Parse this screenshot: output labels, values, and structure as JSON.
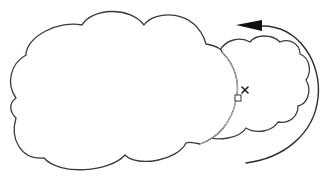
{
  "diagram": {
    "shapes": [
      {
        "id": "cloud-main",
        "label": "",
        "type": "cloud"
      },
      {
        "id": "cloud-rotated-ghost",
        "label": "",
        "type": "cloud"
      }
    ],
    "rotation_arrow": {
      "direction": "counterclockwise"
    },
    "handle": {
      "type": "square-handle"
    },
    "pivot": {
      "type": "x-mark"
    },
    "colors": {
      "outline": "#3a3a3a",
      "ghost_outline": "#b8b8b8",
      "arrow": "#111111",
      "background": "#ffffff"
    }
  }
}
